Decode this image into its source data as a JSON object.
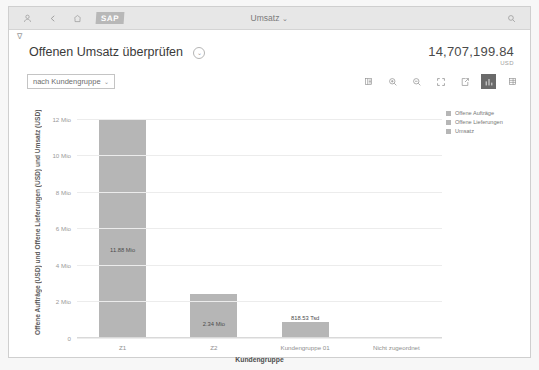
{
  "shellbar": {
    "icons": [
      "user-icon",
      "back-icon",
      "home-icon"
    ],
    "logo": "SAP",
    "title": "Umsatz",
    "title_caret": "⌄",
    "search_icon": "search-icon"
  },
  "header": {
    "filter_glyph": "∇",
    "title": "Offenen Umsatz überprüfen",
    "title_caret": "⌄",
    "kpi_value": "14,707,199.84",
    "kpi_unit": "USD"
  },
  "toolbar": {
    "dimension_select": {
      "value": "nach Kundengruppe",
      "caret": "⌄"
    },
    "icons": [
      {
        "name": "legend-icon",
        "label": "Legende",
        "selected": false
      },
      {
        "name": "zoom-in-icon",
        "label": "Vergrößern",
        "selected": false
      },
      {
        "name": "zoom-out-icon",
        "label": "Verkleinern",
        "selected": false
      },
      {
        "name": "fullscreen-icon",
        "label": "Vollbild",
        "selected": false
      },
      {
        "name": "export-icon",
        "label": "Exportieren",
        "selected": false
      },
      {
        "name": "bar-chart-icon",
        "label": "Diagramm",
        "selected": true
      },
      {
        "name": "table-view-icon",
        "label": "Tabelle",
        "selected": false
      }
    ]
  },
  "legend": {
    "items": [
      {
        "label": "Offene Aufträge",
        "color": "#b6b6b6"
      },
      {
        "label": "Offene Lieferungen",
        "color": "#b6b6b6"
      },
      {
        "label": "Umsatz",
        "color": "#b6b6b6"
      }
    ]
  },
  "chart_data": {
    "type": "bar",
    "title": "Offenen Umsatz überprüfen",
    "categories": [
      "Z1",
      "Z2",
      "Kundengruppe 01",
      "Nicht zugeordnet"
    ],
    "values": [
      11880000,
      2340000,
      818530,
      0
    ],
    "value_labels": [
      "11.88 Mio",
      "2.34 Mio",
      "818.53 Tsd",
      ""
    ],
    "series": [
      {
        "name": "Umsatz",
        "values": [
          11880000,
          2340000,
          818530,
          0
        ],
        "color": "#b6b6b6"
      }
    ],
    "xlabel": "Kundengruppe",
    "ylabel": "Offene Aufträge (USD) und Offene Lieferungen (USD) und Umsatz (USD)",
    "ylim": [
      0,
      12600000
    ],
    "yticks": [
      0,
      2000000,
      4000000,
      6000000,
      8000000,
      10000000,
      12000000
    ],
    "ytick_labels": [
      "0",
      "2 Mio",
      "4 Mio",
      "6 Mio",
      "8 Mio",
      "10 Mio",
      "12 Mio"
    ],
    "grid": true,
    "legend_position": "right"
  }
}
